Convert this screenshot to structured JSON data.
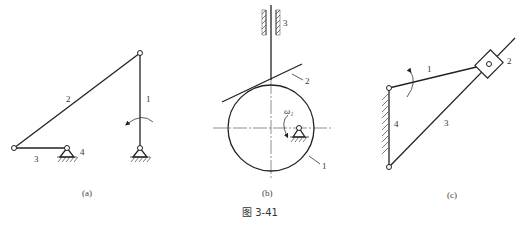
{
  "figure": {
    "title": "图  3-41",
    "background": "#ffffff",
    "line_color": "#222222"
  },
  "subfigures": [
    {
      "id": "a",
      "caption": "(a)",
      "description": "Four-bar linkage",
      "labels": {
        "link1": "1",
        "link2": "2",
        "link3": "3",
        "link4": "4"
      },
      "annotations": [
        "rotation-arrow on link 1"
      ]
    },
    {
      "id": "b",
      "caption": "(b)",
      "description": "Eccentric circular cam with flat-faced follower",
      "labels": {
        "cam": "1",
        "follower_face": "2",
        "guide": "3",
        "angular_velocity": "ω₁"
      }
    },
    {
      "id": "c",
      "caption": "(c)",
      "description": "Crank and oscillating slotted-link mechanism",
      "labels": {
        "crank": "1",
        "slider": "2",
        "rocker": "3",
        "frame": "4"
      },
      "annotations": [
        "rotation-arrow on link 1"
      ]
    }
  ]
}
